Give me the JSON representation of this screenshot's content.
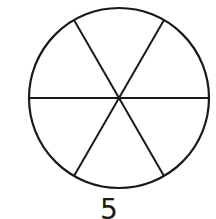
{
  "diagram": {
    "shape": "circle",
    "divisions": 6,
    "spoke_angles_deg": [
      0,
      60,
      120,
      180,
      240,
      300
    ],
    "stroke_color": "#1a1a1a",
    "fill_color": "#ffffff",
    "center": [
      119,
      98
    ],
    "radius": 90
  },
  "caption": {
    "label": "5"
  }
}
